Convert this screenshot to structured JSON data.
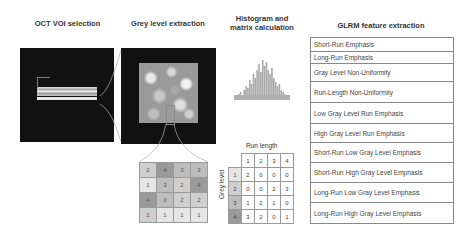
{
  "titles": {
    "oct": "OCT VOI selection",
    "grey": "Grey level extraction",
    "histogram_line1": "Histogram and",
    "histogram_line2": "matrix calculation",
    "glrm": "GLRM feature extraction"
  },
  "grey_level_grid": [
    [
      2,
      4,
      3,
      3
    ],
    [
      1,
      3,
      2,
      4
    ],
    [
      4,
      3,
      2,
      2
    ],
    [
      2,
      1,
      1,
      1
    ]
  ],
  "grey_level_colors": {
    "1": "#e6e6e6",
    "2": "#cfcfcf",
    "3": "#bdbdbd",
    "4": "#9a9a9a"
  },
  "run_length_matrix": {
    "column_title": "Run length",
    "row_title": "Grey level",
    "columns": [
      "1",
      "2",
      "3",
      "4"
    ],
    "rows": [
      {
        "label": "1",
        "values": [
          2,
          0,
          0,
          0
        ]
      },
      {
        "label": "2",
        "values": [
          0,
          0,
          2,
          3
        ]
      },
      {
        "label": "3",
        "values": [
          1,
          2,
          1,
          0
        ]
      },
      {
        "label": "4",
        "values": [
          3,
          2,
          0,
          1
        ]
      }
    ]
  },
  "glrm_features": [
    "Short-Run Emphasis",
    "Long-Run Emphasis",
    "Gray Level Non-Uniformity",
    "Run-Length Non-Uniformity",
    "Low Gray Level Run Emphasis",
    "High Gray Level Run Emphasis",
    "Short-Run Low Gray Level Emphasis",
    "Short-Run High Gray Level Emphasis",
    "Long-Run Low Gray Level Emphasis",
    "Long-Run High Gray Level Emphasis"
  ]
}
